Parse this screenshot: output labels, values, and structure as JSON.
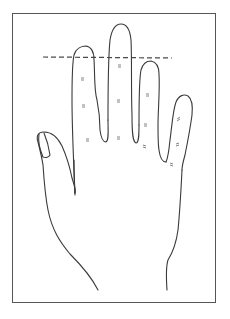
{
  "figure": {
    "type": "hand-outline-diagram",
    "colors": {
      "background": "#ffffff",
      "frame": "#555555",
      "outline": "#3a3a3a",
      "dashed_line": "#4a4a4a",
      "crease_marks": "#666666"
    },
    "elements": {
      "frame": "rectangular-border",
      "reference_line": "dashed-horizontal-line",
      "fingers": [
        "thumb",
        "index",
        "middle",
        "ring",
        "little"
      ],
      "crease_mark_count": 14
    }
  }
}
